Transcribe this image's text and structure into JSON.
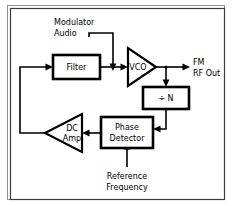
{
  "diagram": {
    "width": 233,
    "height": 206,
    "colors": {
      "background": "#ffffff",
      "stroke": "#000000",
      "frame": "#3c3c3c",
      "frame_shadow": "#8e8e8e"
    },
    "blocks": {
      "filter": {
        "label": "Filter",
        "shape": "rectangle"
      },
      "vco": {
        "label": "VCO",
        "shape": "triangle-right"
      },
      "divider": {
        "label": "÷ N",
        "shape": "rectangle"
      },
      "phase_detector": {
        "label_line1": "Phase",
        "label_line2": "Detector",
        "shape": "rectangle"
      },
      "dc_amp": {
        "label_line1": "DC",
        "label_line2": "Amp",
        "shape": "triangle-left"
      }
    },
    "labels": {
      "modulator_audio_line1": "Modulator",
      "modulator_audio_line2": "Audio",
      "fm_rf_out_line1": "FM",
      "fm_rf_out_line2": "RF  Out",
      "reference_line1": "Reference",
      "reference_line2": "Frequency"
    }
  }
}
